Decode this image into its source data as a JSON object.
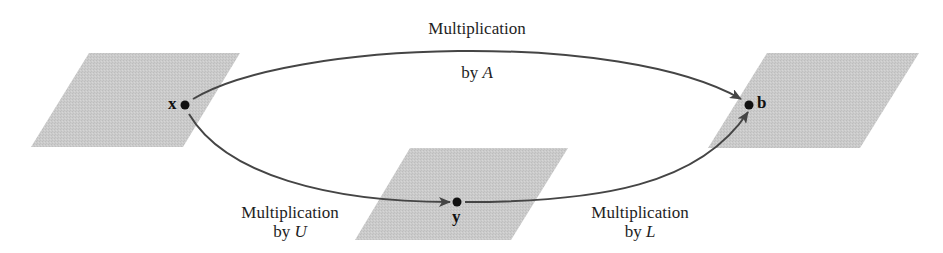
{
  "diagram": {
    "colors": {
      "plane_fill": "#c9c9c9",
      "arrow_stroke": "#454545",
      "point_fill": "#111111",
      "text": "#1e1e1e"
    },
    "planes": [
      {
        "id": "domain-plane",
        "points": [
          [
            89,
            53
          ],
          [
            240,
            53
          ],
          [
            183,
            147
          ],
          [
            31,
            147
          ]
        ]
      },
      {
        "id": "intermediate-plane",
        "points": [
          [
            410,
            148
          ],
          [
            568,
            148
          ],
          [
            511,
            240
          ],
          [
            355,
            240
          ]
        ]
      },
      {
        "id": "codomain-plane",
        "points": [
          [
            767,
            53
          ],
          [
            919,
            53
          ],
          [
            860,
            148
          ],
          [
            708,
            148
          ]
        ]
      }
    ],
    "points": {
      "x": {
        "label": "x",
        "cx": 185,
        "cy": 105
      },
      "y": {
        "label": "y",
        "cx": 457,
        "cy": 202
      },
      "b": {
        "label": "b",
        "cx": 749,
        "cy": 105
      }
    },
    "arrows": {
      "top": {
        "from": "x",
        "to": "b",
        "label_line1": "Multiplication",
        "label_line2_prefix": "by ",
        "label_line2_var": "A"
      },
      "lower_left": {
        "from": "x",
        "to": "y",
        "label_line1": "Multiplication",
        "label_line2_prefix": "by ",
        "label_line2_var": "U"
      },
      "lower_right": {
        "from": "y",
        "to": "b",
        "label_line1": "Multiplication",
        "label_line2_prefix": "by ",
        "label_line2_var": "L"
      }
    }
  }
}
